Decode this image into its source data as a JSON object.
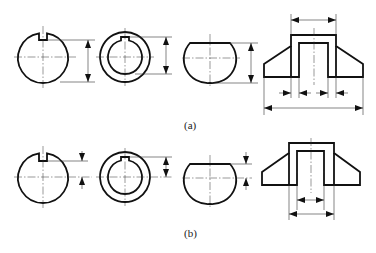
{
  "figure": {
    "type": "engineering dimensioning examples",
    "panels": [
      {
        "id": "a",
        "caption": "(a)",
        "views": [
          "keyed-shaft-section",
          "keyed-hub-section",
          "flat-cut-round-section",
          "u-bracket-front-view"
        ]
      },
      {
        "id": "b",
        "caption": "(b)",
        "views": [
          "keyed-shaft-section",
          "keyed-hub-section",
          "flat-cut-round-section",
          "u-bracket-front-view"
        ]
      }
    ]
  },
  "labels": {
    "a": "(a)",
    "b": "(b)"
  },
  "colors": {
    "line": "#111111",
    "background": "#ffffff"
  }
}
